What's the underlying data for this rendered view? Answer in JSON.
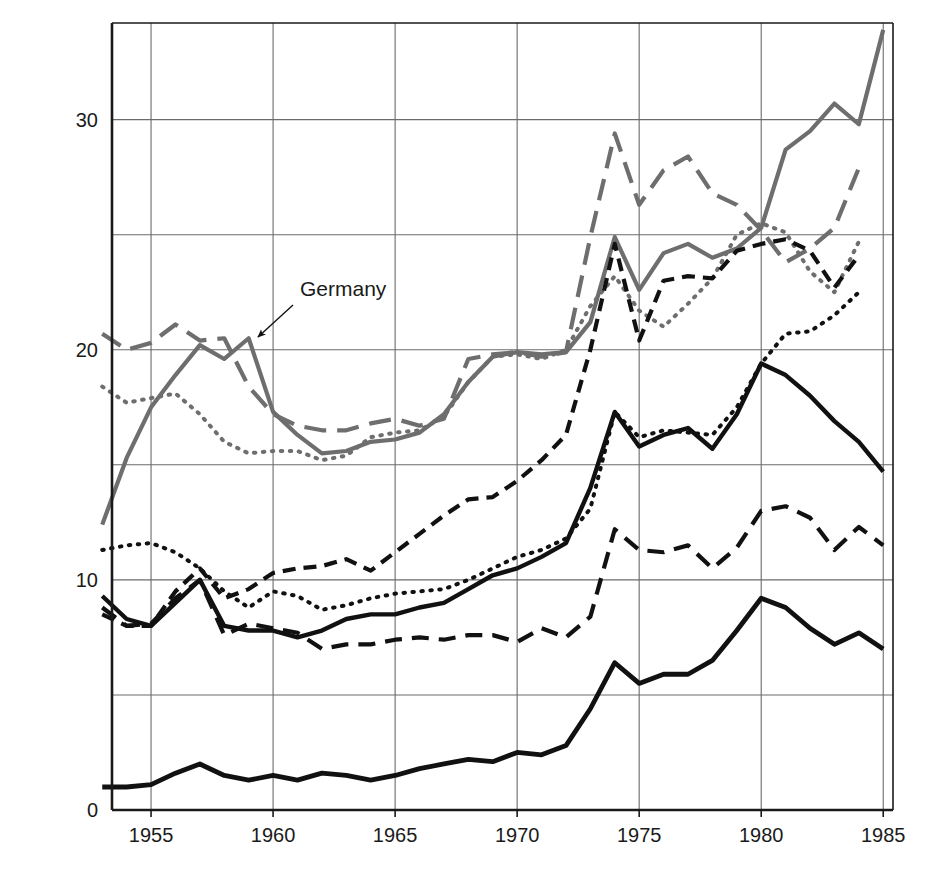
{
  "chart_data": {
    "type": "line",
    "title": "",
    "subtitle": "",
    "xlabel": "",
    "ylabel": "PERCENTAGE OF GNP",
    "xlim": [
      1953.4,
      1985.4
    ],
    "ylim": [
      0,
      34.2
    ],
    "grid": true,
    "legend_position": "inline-annotations",
    "y_ticks": [
      "0",
      "10",
      "20",
      "30"
    ],
    "y_tick_values": [
      0,
      10,
      20,
      30
    ],
    "x_ticks": [
      "1955",
      "1960",
      "1965",
      "1970",
      "1975",
      "1980",
      "1985"
    ],
    "x_tick_values": [
      1955,
      1960,
      1965,
      1970,
      1975,
      1980,
      1985
    ],
    "y_gridlines": [
      0,
      5,
      10,
      15,
      20,
      25,
      30
    ],
    "series": [
      {
        "name": "Germany",
        "style": "solid",
        "color": "#6e6e6e",
        "width": 4.2,
        "x": [
          1953,
          1954,
          1955,
          1956,
          1957,
          1958,
          1959,
          1960,
          1961,
          1962,
          1963,
          1964,
          1965,
          1966,
          1967,
          1968,
          1969,
          1970,
          1971,
          1972,
          1973,
          1974,
          1975,
          1976,
          1977,
          1978,
          1979,
          1980,
          1981,
          1982,
          1983,
          1984,
          1985
        ],
        "values": [
          12.4,
          15.3,
          17.5,
          18.9,
          20.2,
          19.6,
          20.5,
          17.3,
          16.3,
          15.5,
          15.6,
          16.0,
          16.1,
          16.4,
          17.2,
          18.6,
          19.7,
          19.9,
          19.8,
          19.9,
          21.2,
          24.9,
          22.6,
          24.2,
          24.6,
          24.0,
          24.4,
          25.3,
          28.7,
          29.5,
          30.7,
          29.8,
          33.9
        ]
      },
      {
        "name": "United Kingdom",
        "style": "dashed-long",
        "color": "#6e6e6e",
        "width": 4.2,
        "x": [
          1953,
          1954,
          1955,
          1956,
          1957,
          1958,
          1959,
          1960,
          1961,
          1962,
          1963,
          1964,
          1965,
          1966,
          1967,
          1968,
          1969,
          1970,
          1971,
          1972,
          1973,
          1974,
          1975,
          1976,
          1977,
          1978,
          1979,
          1980,
          1981,
          1982,
          1983,
          1984
        ],
        "values": [
          20.7,
          20.0,
          20.3,
          21.1,
          20.4,
          20.5,
          18.4,
          17.2,
          16.7,
          16.5,
          16.5,
          16.8,
          17.0,
          16.7,
          17.0,
          19.6,
          19.8,
          19.9,
          19.7,
          19.9,
          24.9,
          29.4,
          26.3,
          27.8,
          28.4,
          26.8,
          26.3,
          25.2,
          23.8,
          24.4,
          25.3,
          27.9
        ]
      },
      {
        "name": "Canada",
        "style": "dotted",
        "color": "#6e6e6e",
        "width": 4.0,
        "x": [
          1953,
          1954,
          1955,
          1956,
          1957,
          1958,
          1959,
          1960,
          1961,
          1962,
          1963,
          1964,
          1965,
          1966,
          1967,
          1968,
          1969,
          1970,
          1971,
          1972,
          1973,
          1974,
          1975,
          1976,
          1977,
          1978,
          1979,
          1980,
          1981,
          1982,
          1983,
          1984
        ],
        "values": [
          18.4,
          17.7,
          17.9,
          18.1,
          17.2,
          16.0,
          15.5,
          15.6,
          15.6,
          15.2,
          15.4,
          16.2,
          16.4,
          16.5,
          17.1,
          18.6,
          19.7,
          19.8,
          19.6,
          20.0,
          21.9,
          23.2,
          21.7,
          21.0,
          22.0,
          23.1,
          25.0,
          25.5,
          25.1,
          23.4,
          22.5,
          24.7
        ]
      },
      {
        "name": "Italy",
        "style": "dashed-black",
        "color": "#111111",
        "width": 4.2,
        "x": [
          1953,
          1954,
          1955,
          1956,
          1957,
          1958,
          1959,
          1960,
          1961,
          1962,
          1963,
          1964,
          1965,
          1966,
          1967,
          1968,
          1969,
          1970,
          1971,
          1972,
          1973,
          1974,
          1975,
          1976,
          1977,
          1978,
          1979,
          1980,
          1981,
          1982,
          1983,
          1984
        ],
        "values": [
          8.5,
          8.0,
          8.0,
          9.5,
          10.5,
          9.2,
          9.6,
          10.3,
          10.5,
          10.6,
          10.9,
          10.4,
          11.2,
          12.0,
          12.8,
          13.5,
          13.6,
          14.3,
          15.2,
          16.3,
          20.0,
          24.6,
          20.4,
          23.0,
          23.2,
          23.1,
          24.3,
          24.6,
          24.8,
          24.3,
          22.7,
          24.1
        ]
      },
      {
        "name": "France",
        "style": "dotted-black",
        "color": "#111111",
        "width": 4.0,
        "x": [
          1953,
          1954,
          1955,
          1956,
          1957,
          1958,
          1959,
          1960,
          1961,
          1962,
          1963,
          1964,
          1965,
          1966,
          1967,
          1968,
          1969,
          1970,
          1971,
          1972,
          1973,
          1974,
          1975,
          1976,
          1977,
          1978,
          1979,
          1980,
          1981,
          1982,
          1983,
          1984
        ],
        "values": [
          11.3,
          11.5,
          11.6,
          11.2,
          10.5,
          9.5,
          8.8,
          9.5,
          9.3,
          8.7,
          8.9,
          9.2,
          9.4,
          9.5,
          9.6,
          10.0,
          10.5,
          11.0,
          11.3,
          11.8,
          13.1,
          17.3,
          16.2,
          16.5,
          16.4,
          16.3,
          17.5,
          19.4,
          20.7,
          20.8,
          21.5,
          22.5
        ]
      },
      {
        "name": "World",
        "style": "solid-black",
        "color": "#111111",
        "width": 4.4,
        "x": [
          1953,
          1954,
          1955,
          1956,
          1957,
          1958,
          1959,
          1960,
          1961,
          1962,
          1963,
          1964,
          1965,
          1966,
          1967,
          1968,
          1969,
          1970,
          1971,
          1972,
          1973,
          1974,
          1975,
          1976,
          1977,
          1978,
          1979,
          1980,
          1981,
          1982,
          1983,
          1984,
          1985
        ],
        "values": [
          9.3,
          8.3,
          8.0,
          9.0,
          10.0,
          8.0,
          7.8,
          7.8,
          7.5,
          7.8,
          8.3,
          8.5,
          8.5,
          8.8,
          9.0,
          9.6,
          10.2,
          10.5,
          11.0,
          11.6,
          14.0,
          17.3,
          15.8,
          16.3,
          16.6,
          15.7,
          17.2,
          19.4,
          18.9,
          18.0,
          16.9,
          16.0,
          14.7
        ]
      },
      {
        "name": "Japan",
        "style": "dashed-med",
        "color": "#111111",
        "width": 4.2,
        "x": [
          1953,
          1954,
          1955,
          1956,
          1957,
          1958,
          1959,
          1960,
          1961,
          1962,
          1963,
          1964,
          1965,
          1966,
          1967,
          1968,
          1969,
          1970,
          1971,
          1972,
          1973,
          1974,
          1975,
          1976,
          1977,
          1978,
          1979,
          1980,
          1981,
          1982,
          1983,
          1984,
          1985
        ],
        "values": [
          8.8,
          8.0,
          8.1,
          9.2,
          10.0,
          7.6,
          8.1,
          7.9,
          7.7,
          7.0,
          7.2,
          7.2,
          7.4,
          7.5,
          7.4,
          7.6,
          7.6,
          7.3,
          7.9,
          7.5,
          8.4,
          12.2,
          11.3,
          11.2,
          11.5,
          10.5,
          11.4,
          13.0,
          13.2,
          12.7,
          11.3,
          12.3,
          11.5
        ]
      },
      {
        "name": "United States",
        "style": "solid-black-thick",
        "color": "#111111",
        "width": 4.8,
        "x": [
          1953,
          1954,
          1955,
          1956,
          1957,
          1958,
          1959,
          1960,
          1961,
          1962,
          1963,
          1964,
          1965,
          1966,
          1967,
          1968,
          1969,
          1970,
          1971,
          1972,
          1973,
          1974,
          1975,
          1976,
          1977,
          1978,
          1979,
          1980,
          1981,
          1982,
          1983,
          1984,
          1985
        ],
        "values": [
          1.0,
          1.0,
          1.1,
          1.6,
          2.0,
          1.5,
          1.3,
          1.5,
          1.3,
          1.6,
          1.5,
          1.3,
          1.5,
          1.8,
          2.0,
          2.2,
          2.1,
          2.5,
          2.4,
          2.8,
          4.4,
          6.4,
          5.5,
          5.9,
          5.9,
          6.5,
          7.8,
          9.2,
          8.8,
          7.9,
          7.2,
          7.7,
          7.0
        ]
      }
    ],
    "annotations": [
      {
        "label": "Germany",
        "x": 300,
        "y": 296,
        "anchor": "start",
        "arrow": {
          "x1": 293,
          "y1": 305,
          "x2": 258,
          "y2": 337
        },
        "leader": null
      },
      {
        "label": "United Kingdom",
        "x": 281,
        "y": 360,
        "anchor": "start",
        "arrow": {
          "x1": 348,
          "y1": 370,
          "x2": 310,
          "y2": 402
        },
        "leader": {
          "x1": 266,
          "y1": 352,
          "x2": 276,
          "y2": 352,
          "x3": 415,
          "y3": 352,
          "x4": 500,
          "y4": 352
        }
      },
      {
        "label": "Canada",
        "x": 271,
        "y": 460,
        "anchor": "start",
        "arrow": {
          "x1": 264,
          "y1": 452,
          "x2": 234,
          "y2": 424
        },
        "leader": null
      },
      {
        "label": "Italy",
        "x": 413,
        "y": 462,
        "anchor": "start",
        "arrow": {
          "x1": 458,
          "y1": 470,
          "x2": 486,
          "y2": 495
        },
        "leader": null
      },
      {
        "label": "France",
        "x": 197,
        "y": 527,
        "anchor": "start",
        "arrow": {
          "x1": 192,
          "y1": 533,
          "x2": 161,
          "y2": 546
        },
        "leader": null
      },
      {
        "label": "World",
        "x": 772,
        "y": 452,
        "anchor": "start",
        "arrow": {
          "x1": 790,
          "y1": 443,
          "x2": 790,
          "y2": 393
        },
        "leader": null
      },
      {
        "label": "Japan",
        "x": 335,
        "y": 711,
        "anchor": "start",
        "arrow": {
          "x1": 396,
          "y1": 702,
          "x2": 427,
          "y2": 662
        },
        "leader": null
      },
      {
        "label": "United States",
        "x": 644,
        "y": 711,
        "anchor": "start",
        "arrow": {
          "x1": 639,
          "y1": 701,
          "x2": 615,
          "y2": 672
        },
        "leader": null
      }
    ]
  },
  "axes": {
    "y_axis_title": "PERCENTAGE OF GNP",
    "y_tick_labels": [
      "30",
      "20",
      "10",
      "0"
    ],
    "x_tick_labels": [
      "1955",
      "1960",
      "1965",
      "1970",
      "1975",
      "1980",
      "1985"
    ]
  },
  "colors": {
    "gray_series": "#6e6e6e",
    "black_series": "#111111",
    "gridline": "#6b6b6b",
    "axis": "#1a1a1a",
    "background": "#ffffff"
  }
}
